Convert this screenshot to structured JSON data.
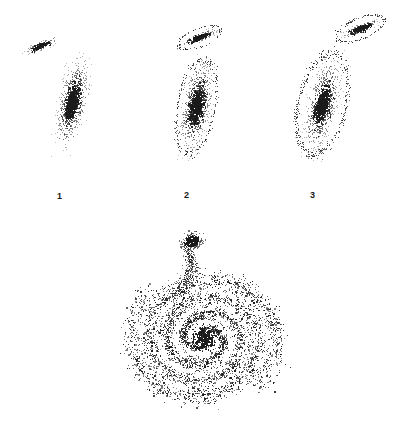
{
  "figure": {
    "kind": "particle-scatter-simulation-figure",
    "background_color": "#ffffff",
    "particle_color": "#1a1a1a",
    "width": 400,
    "height": 425
  },
  "labels": [
    {
      "text": "1",
      "x": 57,
      "y": 192
    },
    {
      "text": "2",
      "x": 184,
      "y": 191
    },
    {
      "text": "3",
      "x": 310,
      "y": 191
    }
  ],
  "chart_data": {
    "type": "scatter",
    "title": "",
    "subtitle": "",
    "xlabel": "",
    "ylabel": "",
    "grid": false,
    "legend": "none",
    "axes_visible": false,
    "point_color": "#1a1a1a",
    "background": "#ffffff",
    "panels": [
      {
        "id": "panel-1",
        "label": "1",
        "view": "edge-on",
        "bounds": {
          "x": 8,
          "y": 18,
          "w": 118,
          "h": 160
        },
        "label_position": {
          "x": 57,
          "y": 192
        },
        "objects": [
          {
            "name": "companion-galaxy",
            "shape": "elongated-bar",
            "center": {
              "x": 41,
              "y": 45
            },
            "rx": 18,
            "ry": 4.2,
            "rotation_deg": -24,
            "core_rx": 8,
            "core_ry": 2.2,
            "n_points": 150,
            "core_points": 90,
            "ring": false
          },
          {
            "name": "primary-disk",
            "shape": "edge-on-disk",
            "center": {
              "x": 72,
              "y": 101
            },
            "rx": 13.5,
            "ry": 43,
            "rotation_deg": 11,
            "core_rx": 5.5,
            "core_ry": 17,
            "n_points": 760,
            "core_points": 330,
            "ring": false
          }
        ]
      },
      {
        "id": "panel-2",
        "label": "2",
        "view": "edge-on",
        "bounds": {
          "x": 152,
          "y": 15,
          "w": 118,
          "h": 162
        },
        "label_position": {
          "x": 184,
          "y": 191
        },
        "objects": [
          {
            "name": "companion-galaxy",
            "shape": "elongated-bar",
            "center": {
              "x": 199,
              "y": 37
            },
            "rx": 19,
            "ry": 4.5,
            "rotation_deg": -22,
            "core_rx": 9,
            "core_ry": 2.4,
            "n_points": 185,
            "core_points": 110,
            "ring": true,
            "ring_rx": 23,
            "ring_ry": 9,
            "ring_points": 70
          },
          {
            "name": "primary-disk",
            "shape": "edge-on-disk",
            "center": {
              "x": 196,
              "y": 106
            },
            "rx": 14.5,
            "ry": 44,
            "rotation_deg": 10,
            "core_rx": 6,
            "core_ry": 17,
            "n_points": 820,
            "core_points": 350,
            "ring": true,
            "ring_rx": 19,
            "ring_ry": 48,
            "ring_points": 200
          }
        ]
      },
      {
        "id": "panel-3",
        "label": "3",
        "view": "edge-on",
        "bounds": {
          "x": 282,
          "y": 10,
          "w": 116,
          "h": 166
        },
        "label_position": {
          "x": 310,
          "y": 191
        },
        "objects": [
          {
            "name": "companion-galaxy",
            "shape": "elongated-bar",
            "center": {
              "x": 360,
              "y": 28
            },
            "rx": 19,
            "ry": 4.5,
            "rotation_deg": -22,
            "core_rx": 10,
            "core_ry": 2.6,
            "n_points": 180,
            "core_points": 115,
            "ring": true,
            "ring_rx": 25,
            "ring_ry": 10.5,
            "ring_points": 110
          },
          {
            "name": "primary-disk",
            "shape": "edge-on-disk",
            "center": {
              "x": 322,
              "y": 104
            },
            "rx": 15,
            "ry": 44,
            "rotation_deg": 13,
            "core_rx": 6,
            "core_ry": 16,
            "n_points": 800,
            "core_points": 340,
            "ring": true,
            "ring_rx": 24,
            "ring_ry": 52,
            "ring_points": 330
          }
        ]
      },
      {
        "id": "panel-4",
        "label": "",
        "view": "face-on",
        "bounds": {
          "x": 110,
          "y": 222,
          "w": 195,
          "h": 200
        },
        "label_position": null,
        "objects": [
          {
            "name": "spiral-primary",
            "shape": "spiral-disk",
            "center": {
              "x": 203,
              "y": 338
            },
            "outer_radius": 78,
            "inner_radius": 6,
            "arms": 2,
            "turns": 2.15,
            "ellipse_ratio": 0.9,
            "tilt_deg": -8,
            "n_points": 3400
          },
          {
            "name": "companion-core",
            "shape": "blob",
            "center": {
              "x": 191,
              "y": 241
            },
            "rx": 11,
            "ry": 8,
            "rotation_deg": -18,
            "n_points": 230
          },
          {
            "name": "tidal-bridge",
            "shape": "stream",
            "from": {
              "x": 188,
              "y": 249
            },
            "to": {
              "x": 172,
              "y": 300
            },
            "spread": 9,
            "n_points": 380
          }
        ]
      }
    ]
  }
}
